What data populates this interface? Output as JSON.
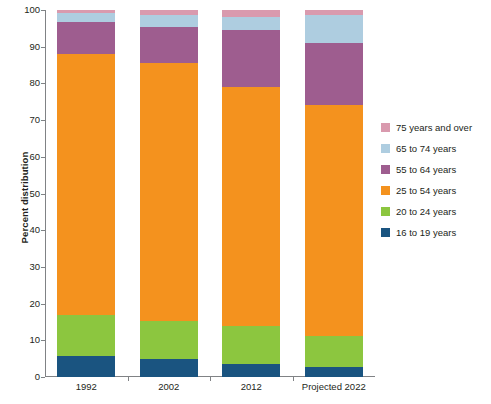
{
  "chart_data": {
    "type": "bar",
    "subtype": "stacked-bar-100-percent",
    "title": "",
    "xlabel": "",
    "ylabel": "Percent distribution",
    "ylim": [
      0,
      100
    ],
    "yticks": [
      0,
      10,
      20,
      30,
      40,
      50,
      60,
      70,
      80,
      90,
      100
    ],
    "ytick_labels": [
      "0",
      "10",
      "20",
      "30",
      "40",
      "50",
      "60",
      "70",
      "80",
      "90",
      "100"
    ],
    "grid": false,
    "legend_position": "right",
    "categories": [
      "1992",
      "2002",
      "2012",
      "Projected 2022"
    ],
    "series": [
      {
        "name": "16 to 19 years",
        "color": "#1a5480",
        "values": [
          5.8,
          5.0,
          3.5,
          2.7
        ]
      },
      {
        "name": "20 to 24 years",
        "color": "#8cc63f",
        "values": [
          11.2,
          10.2,
          10.5,
          8.6
        ]
      },
      {
        "name": "25 to 54 years",
        "color": "#f4921e",
        "values": [
          71.0,
          70.3,
          65.0,
          62.7
        ]
      },
      {
        "name": "55 to 64 years",
        "color": "#9e5d8f",
        "values": [
          8.8,
          10.0,
          15.5,
          17.0
        ]
      },
      {
        "name": "65 to 74 years",
        "color": "#aecde0",
        "values": [
          2.5,
          3.1,
          3.7,
          7.6
        ]
      },
      {
        "name": "75 years and over",
        "color": "#d99aae",
        "values": [
          0.7,
          1.4,
          1.8,
          1.4
        ]
      }
    ],
    "stack_order_bottom_to_top": [
      "16 to 19 years",
      "20 to 24 years",
      "25 to 54 years",
      "55 to 64 years",
      "65 to 74 years",
      "75 years and over"
    ],
    "cumulative_tops": {
      "1992": [
        5.8,
        17.0,
        88.0,
        96.8,
        99.3,
        100.0
      ],
      "2002": [
        5.0,
        15.2,
        85.5,
        95.5,
        98.6,
        100.0
      ],
      "2012": [
        3.5,
        14.0,
        79.0,
        94.5,
        98.2,
        100.0
      ],
      "Projected 2022": [
        2.7,
        11.3,
        74.0,
        91.0,
        98.6,
        100.0
      ]
    }
  },
  "legend": {
    "items": [
      {
        "label": "75 years and over",
        "color": "#d99aae"
      },
      {
        "label": "65 to 74 years",
        "color": "#aecde0"
      },
      {
        "label": "55 to 64 years",
        "color": "#9e5d8f"
      },
      {
        "label": "25 to 54 years",
        "color": "#f4921e"
      },
      {
        "label": "20 to 24 years",
        "color": "#8cc63f"
      },
      {
        "label": "16 to 19 years",
        "color": "#1a5480"
      }
    ]
  },
  "axes": {
    "y_title": "Percent distribution",
    "axis_color": "#808285",
    "text_color": "#231f20"
  }
}
